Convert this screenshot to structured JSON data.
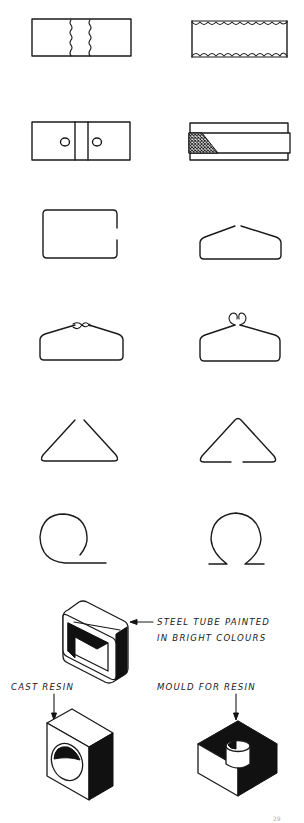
{
  "figure": {
    "rows": [
      {
        "row": 1,
        "left": "rectangle-wavy-vertical-seams",
        "right": "rectangle-scalloped-edges"
      },
      {
        "row": 2,
        "left": "rectangle-two-holes-band",
        "right": "band-with-crosshatch-end"
      },
      {
        "row": 3,
        "left": "open-rectangle-wire",
        "right": "hanger-wire-open-top"
      },
      {
        "row": 4,
        "left": "hanger-wire-twisted-loop",
        "right": "hanger-wire-curl-loops"
      },
      {
        "row": 5,
        "left": "triangle-open-apex",
        "right": "triangle-open-base"
      },
      {
        "row": 6,
        "left": "loop-with-tail",
        "right": "omega-wire"
      }
    ],
    "colors": {
      "ink": "#1a1a1a",
      "fill_dark": "#111111",
      "paper": "#ffffff"
    }
  },
  "labels": {
    "steel_tube_line1": "STEEL TUBE PAINTED",
    "steel_tube_line2": "IN BRIGHT COLOURS",
    "cast_resin": "CAST RESIN",
    "mould_for_resin": "MOULD FOR RESIN"
  },
  "page_number": "29"
}
